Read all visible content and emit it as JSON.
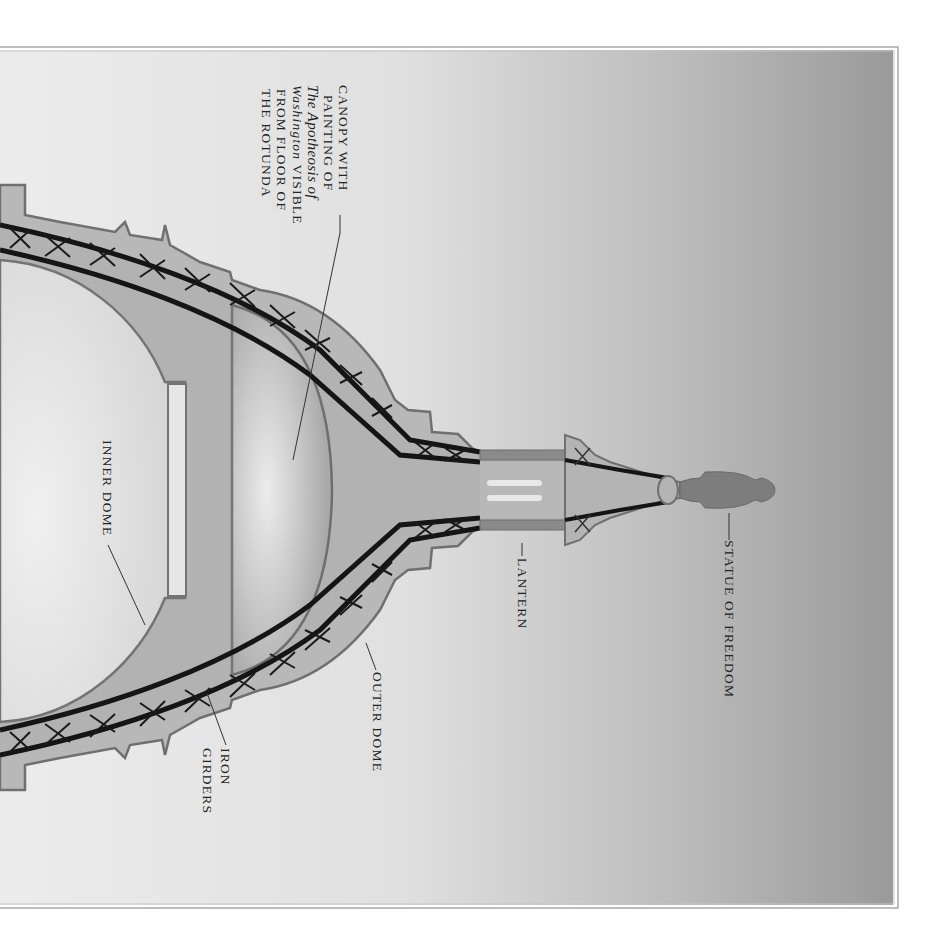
{
  "diagram": {
    "orientation": "rotated 90 degrees clockwise; apex points right",
    "labels": {
      "statue": "STATUE OF FREEDOM",
      "lantern": "LANTERN",
      "outer_dome": "OUTER DOME",
      "iron_girders_line1": "IRON",
      "iron_girders_line2": "GIRDERS",
      "inner_dome": "INNER DOME",
      "canopy_line1": "CANOPY WITH",
      "canopy_line2": "PAINTING OF",
      "canopy_line3_italic": "The Apotheosis of",
      "canopy_line4_italic": "Washington",
      "canopy_line4_rest": " VISIBLE",
      "canopy_line5": "FROM FLOOR OF",
      "canopy_line6": "THE ROTUNDA"
    },
    "colors": {
      "background_light": "#e6e6e6",
      "background_dark": "#9a9a9a",
      "dome_fill": "#b4b4b4",
      "outer_shell": "#a8a8a8",
      "outline": "#6e6e6e",
      "girder": "#1a1a1a",
      "statue": "#7a7a7a",
      "inner_light": "#e4e4e4"
    }
  }
}
